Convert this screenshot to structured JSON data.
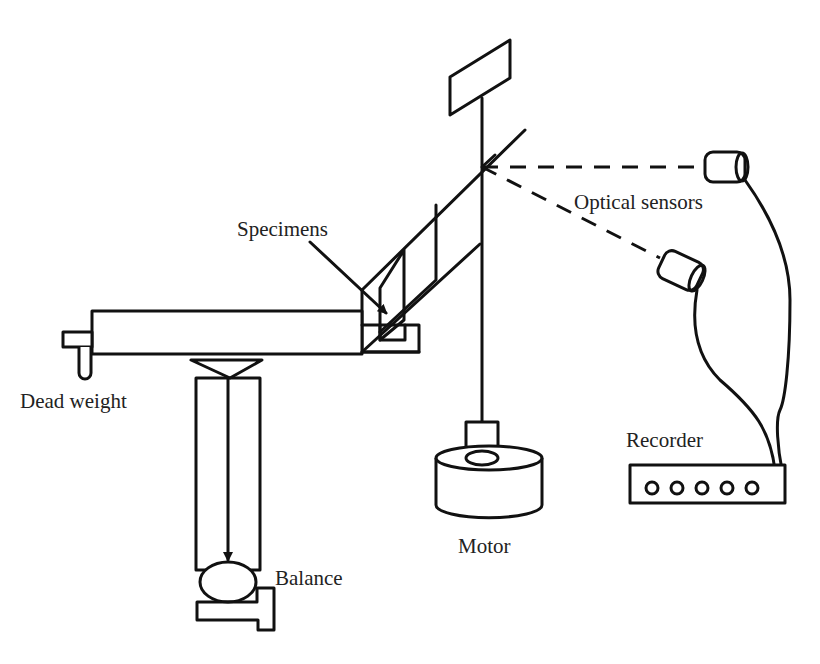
{
  "figure": {
    "type": "schematic diagram of test apparatus",
    "labels": {
      "specimens": "Specimens",
      "optical_sensors": "Optical sensors",
      "dead_weight": "Dead weight",
      "recorder": "Recorder",
      "motor": "Motor",
      "balance": "Balance"
    },
    "components": [
      "loading arm",
      "dead weight",
      "specimens",
      "rotating disk",
      "shaft",
      "flag",
      "optical sensors",
      "recorder",
      "motor",
      "balance"
    ],
    "recorder_indicator_count": 5,
    "colors": {
      "line": "#111111",
      "background": "#ffffff",
      "text": "#222222"
    }
  }
}
